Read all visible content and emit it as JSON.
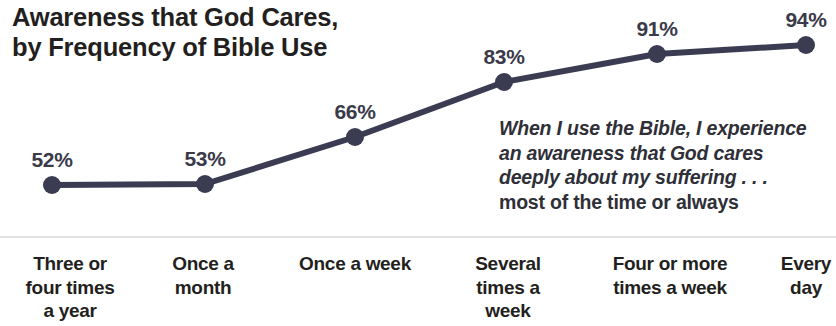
{
  "chart_data": {
    "type": "line",
    "title": "Awareness that God Cares,\nby Frequency of Bible Use",
    "xlabel": "",
    "ylabel": "",
    "ylim": [
      40,
      100
    ],
    "grid": false,
    "legend": "none",
    "categories": [
      "Three or\nfour times\na year",
      "Once a\nmonth",
      "Once a week",
      "Several\ntimes a\nweek",
      "Four or more\ntimes a week",
      "Every\nday"
    ],
    "values": [
      52,
      53,
      66,
      83,
      91,
      94
    ],
    "data_labels": [
      "52%",
      "53%",
      "66%",
      "83%",
      "91%",
      "94%"
    ],
    "annotation": {
      "quote_lines": [
        "When I use the Bible, I experience",
        "an awareness that God cares",
        "deeply about my suffering . . ."
      ],
      "qualifier": "most of the time or always"
    },
    "colors": {
      "line": "#3b3b52",
      "marker": "#3b3b52",
      "title_text": "#231f20",
      "label_text": "#3a3a4a",
      "category_text": "#231f20",
      "axis_rule": "#e2e2e2",
      "background": "#ffffff"
    },
    "geometry": {
      "point_x": [
        52,
        205,
        355,
        504,
        657,
        806
      ],
      "point_y": [
        185,
        184,
        137,
        82,
        54,
        45
      ],
      "label_y": [
        148,
        147,
        100,
        45,
        17,
        8
      ],
      "category_x": [
        70,
        203,
        355,
        508,
        670,
        806
      ],
      "line_width": 6,
      "marker_radius": 9
    }
  }
}
